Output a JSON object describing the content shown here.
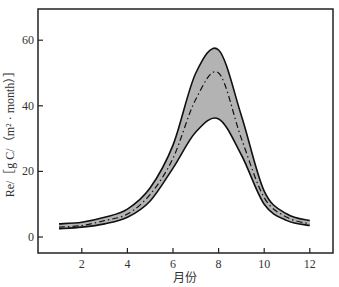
{
  "chart_data": {
    "type": "area",
    "title": "",
    "xlabel": "月份",
    "ylabel": "Re/［g C/（m² · month）］",
    "x": [
      1,
      2,
      3,
      4,
      5,
      6,
      7,
      8,
      9,
      10,
      11,
      12
    ],
    "series": [
      {
        "name": "upper",
        "values": [
          4,
          4.5,
          6,
          8.5,
          15,
          28,
          50,
          57,
          37,
          14,
          7,
          5
        ]
      },
      {
        "name": "mean",
        "values": [
          3,
          3.5,
          5,
          7,
          13,
          24,
          42,
          50,
          30,
          12,
          6,
          4
        ]
      },
      {
        "name": "lower",
        "values": [
          2.5,
          3,
          4,
          6,
          11,
          21,
          32,
          36,
          25,
          10,
          5,
          3.5
        ]
      }
    ],
    "xticks": [
      2,
      4,
      6,
      8,
      10,
      12
    ],
    "yticks": [
      0,
      20,
      40,
      60
    ],
    "xlim": [
      0,
      13
    ],
    "ylim": [
      -5,
      70
    ],
    "grid": false,
    "band_color": "#b3b3b3"
  }
}
